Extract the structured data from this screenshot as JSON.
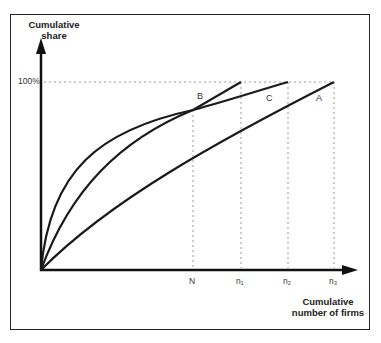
{
  "diagram": {
    "y_axis": {
      "label_line1": "Cumulative",
      "label_line2": "share",
      "top_tick": "100%"
    },
    "x_axis": {
      "label_line1": "Cumulative",
      "label_line2": "number of firms",
      "ticks": [
        "N",
        "n₁",
        "n₂",
        "n₃"
      ]
    },
    "curves": [
      {
        "name": "A",
        "label": "A"
      },
      {
        "name": "B",
        "label": "B"
      },
      {
        "name": "C",
        "label": "C"
      }
    ],
    "colors": {
      "line": "#222222",
      "guide": "#999999",
      "background": "#ffffff"
    }
  }
}
